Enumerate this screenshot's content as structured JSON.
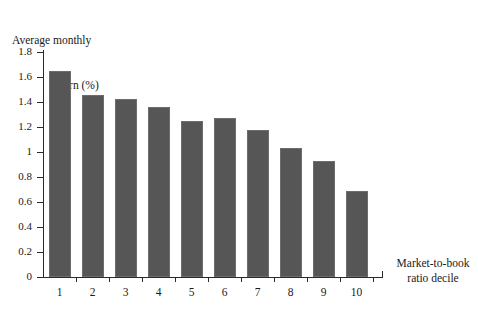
{
  "chart_data": {
    "type": "bar",
    "title": "",
    "xlabel": "Market-to-book ratio decile",
    "ylabel": "Average monthly return (%)",
    "ylabel_line1": "Average monthly",
    "ylabel_line2": "return (%)",
    "xlabel_line1": "Market-to-book",
    "xlabel_line2": "ratio decile",
    "categories": [
      "1",
      "2",
      "3",
      "4",
      "5",
      "6",
      "7",
      "8",
      "9",
      "10"
    ],
    "values": [
      1.645,
      1.455,
      1.425,
      1.36,
      1.25,
      1.27,
      1.18,
      1.03,
      0.925,
      0.685
    ],
    "ylim": [
      0,
      1.8
    ],
    "ytick_labels": [
      "0",
      "0.2",
      "0.4",
      "0.6",
      "0.8",
      "1",
      "1.2",
      "1.4",
      "1.6",
      "1.8"
    ],
    "ytick_values": [
      0,
      0.2,
      0.4,
      0.6,
      0.8,
      1.0,
      1.2,
      1.4,
      1.6,
      1.8
    ],
    "grid": false,
    "legend": "none",
    "bar_color": "#565656",
    "axis_color": "#2a2a2a",
    "background_color": "#ffffff"
  }
}
